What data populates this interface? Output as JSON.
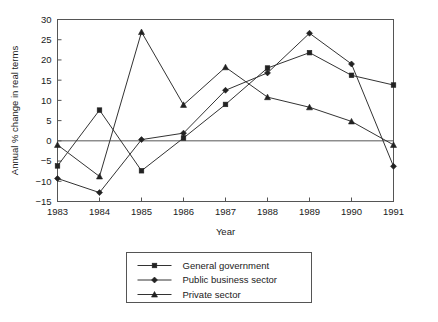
{
  "chart_data": {
    "type": "line",
    "title": "",
    "xlabel": "Year",
    "ylabel": "Annual % change in real terms",
    "x": [
      1983,
      1984,
      1985,
      1986,
      1987,
      1988,
      1989,
      1990,
      1991
    ],
    "categories": [
      "1983",
      "1984",
      "1985",
      "1986",
      "1987",
      "1988",
      "1989",
      "1990",
      "1991"
    ],
    "xlim": [
      1983,
      1991
    ],
    "ylim": [
      -15,
      30
    ],
    "yticks": [
      -15,
      -10,
      -5,
      0,
      5,
      10,
      15,
      20,
      25,
      30
    ],
    "ytick_labels": [
      "−15",
      "−10",
      "−5",
      "0",
      "5",
      "10",
      "15",
      "20",
      "25",
      "30"
    ],
    "grid": false,
    "zero_line": true,
    "legend_position": "below",
    "series": [
      {
        "name": "General government",
        "marker": "square",
        "values": [
          -6.2,
          7.6,
          -7.4,
          0.7,
          9.0,
          18.0,
          21.8,
          16.2,
          13.8
        ]
      },
      {
        "name": "Public business sector",
        "marker": "diamond",
        "values": [
          -9.3,
          -12.8,
          0.3,
          1.9,
          12.5,
          16.8,
          26.6,
          19.0,
          -6.3
        ]
      },
      {
        "name": "Private sector",
        "marker": "triangle",
        "values": [
          -1.0,
          -8.8,
          26.9,
          8.9,
          18.2,
          10.8,
          8.3,
          4.8,
          -1.0
        ]
      }
    ]
  },
  "colors": {
    "line": "#333333",
    "marker": "#222222",
    "axis": "#555555",
    "text": "#1a1a1a",
    "background": "#ffffff"
  },
  "legend": {
    "items": [
      {
        "label": "General government"
      },
      {
        "label": "Public business sector"
      },
      {
        "label": "Private sector"
      }
    ]
  }
}
